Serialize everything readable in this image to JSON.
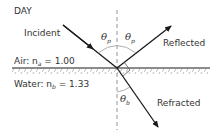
{
  "diagram": {
    "title": "DAY",
    "rays": {
      "incident": "Incident",
      "reflected": "Reflected",
      "refracted": "Refracted"
    },
    "media": {
      "air_label": "Air: n",
      "air_sub": "a",
      "air_value": " = 1.00",
      "water_label": "Water: n",
      "water_sub": "b",
      "water_value": " = 1.33"
    },
    "angles": {
      "theta": "θ",
      "incident_sub": "p",
      "reflected_sub": "p",
      "refracted_sub": "b"
    },
    "colors": {
      "line": "#1a1a1a",
      "dashed": "#888888",
      "hatch": "#aaaaaa",
      "arc": "#999999"
    }
  }
}
